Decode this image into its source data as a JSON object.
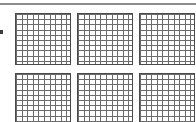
{
  "page": {
    "width_px": 196,
    "height_px": 122,
    "background_color": "#ffffff",
    "description_label": "",
    "top_rule": {
      "color": "#8d8d8d",
      "label": ""
    },
    "margin_mark": {
      "color": "#3a3a3a",
      "label": ""
    }
  },
  "worksheet": {
    "title": "",
    "layout": {
      "rows": 2,
      "columns": 3,
      "total_grids": 6,
      "bottom_row_clipped": true
    },
    "grid_spec": {
      "cells_across": 10,
      "cells_down": 10,
      "total_cells": 100,
      "line_color": "#6b6b6b",
      "border_color": "#4a4a4a",
      "fill_color": "#ffffff"
    },
    "grids": [
      {
        "id": "grid-1",
        "position": "row-1-col-1",
        "label": "",
        "shaded_cells": 0
      },
      {
        "id": "grid-2",
        "position": "row-1-col-2",
        "label": "",
        "shaded_cells": 0
      },
      {
        "id": "grid-3",
        "position": "row-1-col-3",
        "label": "",
        "shaded_cells": 0
      },
      {
        "id": "grid-4",
        "position": "row-2-col-1",
        "label": "",
        "shaded_cells": 0
      },
      {
        "id": "grid-5",
        "position": "row-2-col-2",
        "label": "",
        "shaded_cells": 0
      },
      {
        "id": "grid-6",
        "position": "row-2-col-3",
        "label": "",
        "shaded_cells": 0
      }
    ]
  }
}
